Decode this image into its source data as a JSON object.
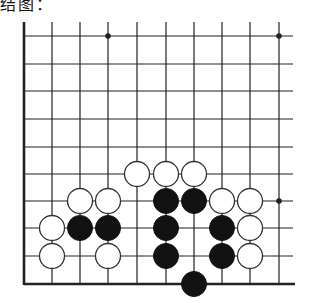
{
  "caption": "结图：",
  "board": {
    "columns": [
      24,
      52,
      80,
      108,
      137,
      166,
      194,
      222,
      250,
      279
    ],
    "rows": [
      36,
      64,
      91,
      119,
      147,
      174,
      201,
      228,
      256,
      284
    ],
    "right_extent": 293,
    "top_extent": 22,
    "line_color": "#222222",
    "edges": {
      "left": true,
      "bottom": true,
      "top": false,
      "right": false
    },
    "star_points": [
      [
        3,
        0
      ],
      [
        9,
        0
      ],
      [
        9,
        6
      ]
    ],
    "stone_radius": 12.5,
    "black_stones": [
      [
        5,
        6
      ],
      [
        6,
        6
      ],
      [
        2,
        7
      ],
      [
        3,
        7
      ],
      [
        5,
        7
      ],
      [
        7,
        7
      ],
      [
        5,
        8
      ],
      [
        7,
        8
      ],
      [
        6,
        9
      ]
    ],
    "white_stones": [
      [
        4,
        5
      ],
      [
        5,
        5
      ],
      [
        6,
        5
      ],
      [
        2,
        6
      ],
      [
        3,
        6
      ],
      [
        7,
        6
      ],
      [
        8,
        6
      ],
      [
        1,
        7
      ],
      [
        8,
        7
      ],
      [
        1,
        8
      ],
      [
        3,
        8
      ],
      [
        8,
        8
      ]
    ],
    "colors": {
      "black": "#111111",
      "white": "#ffffff",
      "stroke": "#333333"
    }
  }
}
